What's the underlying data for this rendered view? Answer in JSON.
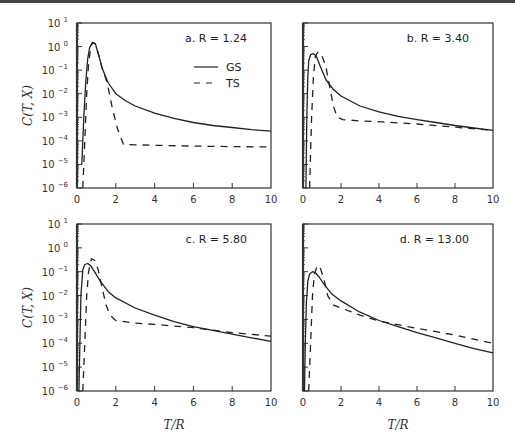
{
  "chart_data": [
    {
      "type": "line",
      "panel": "a",
      "title": "a. R = 1.24",
      "xlabel": "T/R",
      "ylabel": "C(T, X)",
      "xlim": [
        0,
        10
      ],
      "ylim": [
        1e-06,
        10
      ],
      "yscale": "log",
      "xticks": [
        0,
        2,
        4,
        6,
        8,
        10
      ],
      "yticks": [
        "10^1",
        "10^0",
        "10^-1",
        "10^-2",
        "10^-3",
        "10^-4",
        "10^-5",
        "10^-6"
      ],
      "grid": false,
      "legend": [
        "GS",
        "TS"
      ],
      "legend_position": "upper right",
      "series": [
        {
          "name": "GS",
          "style": "solid",
          "x": [
            0.25,
            0.35,
            0.45,
            0.55,
            0.65,
            0.8,
            0.95,
            1.1,
            1.3,
            1.6,
            2.0,
            2.5,
            3,
            4,
            5,
            6,
            7,
            8,
            9,
            10
          ],
          "y": [
            1e-05,
            0.001,
            0.03,
            0.3,
            0.9,
            1.5,
            1.3,
            0.5,
            0.12,
            0.03,
            0.01,
            0.005,
            0.003,
            0.0015,
            0.0009,
            0.0006,
            0.00045,
            0.00037,
            0.0003,
            0.00026
          ]
        },
        {
          "name": "TS",
          "style": "dashed",
          "x": [
            0.3,
            0.4,
            0.5,
            0.6,
            0.7,
            0.8,
            0.95,
            1.1,
            1.3,
            1.55,
            1.8,
            2.1,
            2.4,
            3,
            4,
            6,
            8,
            10
          ],
          "y": [
            1e-06,
            0.0001,
            0.01,
            0.2,
            0.8,
            1.5,
            1.3,
            0.5,
            0.12,
            0.03,
            0.003,
            0.0003,
            7e-05,
            6.8e-05,
            6.5e-05,
            6e-05,
            5.7e-05,
            5.5e-05
          ]
        }
      ]
    },
    {
      "type": "line",
      "panel": "b",
      "title": "b. R = 3.40",
      "xlabel": "",
      "ylabel": "",
      "xlim": [
        0,
        10
      ],
      "ylim": [
        1e-06,
        10
      ],
      "yscale": "log",
      "xticks": [
        0,
        2,
        4,
        6,
        8,
        10
      ],
      "grid": false,
      "series": [
        {
          "name": "GS",
          "style": "solid",
          "x": [
            0.15,
            0.2,
            0.25,
            0.3,
            0.4,
            0.55,
            0.7,
            0.9,
            1.2,
            1.6,
            2,
            3,
            4,
            5,
            6,
            7,
            8,
            9,
            10
          ],
          "y": [
            1e-06,
            0.001,
            0.05,
            0.25,
            0.45,
            0.5,
            0.4,
            0.15,
            0.04,
            0.015,
            0.008,
            0.003,
            0.0017,
            0.0011,
            0.0008,
            0.0006,
            0.00045,
            0.00035,
            0.00028
          ]
        },
        {
          "name": "TS",
          "style": "dashed",
          "x": [
            0.35,
            0.45,
            0.55,
            0.65,
            0.8,
            1.0,
            1.2,
            1.4,
            1.6,
            1.8,
            2.1,
            3,
            4,
            6,
            8,
            9.5,
            10
          ],
          "y": [
            1e-06,
            0.001,
            0.05,
            0.4,
            0.6,
            0.4,
            0.15,
            0.02,
            0.003,
            0.001,
            0.0008,
            0.0007,
            0.00065,
            0.00052,
            0.00038,
            0.0003,
            0.00028
          ]
        }
      ]
    },
    {
      "type": "line",
      "panel": "c",
      "title": "c. R = 5.80",
      "xlabel": "T/R",
      "ylabel": "C(T, X)",
      "xlim": [
        0,
        10
      ],
      "ylim": [
        1e-06,
        10
      ],
      "yscale": "log",
      "xticks": [
        0,
        2,
        4,
        6,
        8,
        10
      ],
      "yticks": [
        "10^1",
        "10^0",
        "10^-1",
        "10^-2",
        "10^-3",
        "10^-4",
        "10^-5",
        "10^-6"
      ],
      "grid": false,
      "series": [
        {
          "name": "GS",
          "style": "solid",
          "x": [
            0.1,
            0.15,
            0.2,
            0.3,
            0.4,
            0.55,
            0.7,
            0.9,
            1.2,
            1.6,
            2,
            3,
            4,
            5,
            6,
            7,
            8,
            9,
            10
          ],
          "y": [
            1e-06,
            0.0001,
            0.01,
            0.12,
            0.2,
            0.22,
            0.18,
            0.1,
            0.04,
            0.015,
            0.008,
            0.003,
            0.0015,
            0.0008,
            0.0005,
            0.00035,
            0.00024,
            0.00017,
            0.00012
          ]
        },
        {
          "name": "TS",
          "style": "dashed",
          "x": [
            0.3,
            0.4,
            0.5,
            0.6,
            0.75,
            0.9,
            1.1,
            1.3,
            1.5,
            1.7,
            2.0,
            3,
            4,
            6,
            8,
            10
          ],
          "y": [
            1e-06,
            0.0001,
            0.01,
            0.1,
            0.35,
            0.3,
            0.12,
            0.02,
            0.004,
            0.0015,
            0.0009,
            0.0007,
            0.00062,
            0.00045,
            0.00028,
            0.0002
          ]
        }
      ]
    },
    {
      "type": "line",
      "panel": "d",
      "title": "d. R = 13.00",
      "xlabel": "T/R",
      "ylabel": "",
      "xlim": [
        0,
        10
      ],
      "ylim": [
        1e-06,
        10
      ],
      "yscale": "log",
      "xticks": [
        0,
        2,
        4,
        6,
        8,
        10
      ],
      "grid": false,
      "series": [
        {
          "name": "GS",
          "style": "solid",
          "x": [
            0.08,
            0.12,
            0.18,
            0.25,
            0.35,
            0.5,
            0.65,
            0.85,
            1.1,
            1.5,
            2,
            3,
            4,
            5,
            6,
            7,
            8,
            9,
            10
          ],
          "y": [
            1e-06,
            0.0001,
            0.005,
            0.04,
            0.08,
            0.1,
            0.09,
            0.06,
            0.03,
            0.012,
            0.006,
            0.002,
            0.0009,
            0.0005,
            0.00028,
            0.00017,
            0.0001,
            6e-05,
            4e-05
          ]
        },
        {
          "name": "TS",
          "style": "dashed",
          "x": [
            0.3,
            0.4,
            0.5,
            0.6,
            0.75,
            0.9,
            1.1,
            1.3,
            1.6,
            2.0,
            3,
            4,
            5,
            6,
            8,
            10
          ],
          "y": [
            1e-06,
            0.0001,
            0.01,
            0.08,
            0.18,
            0.15,
            0.05,
            0.01,
            0.004,
            0.003,
            0.0015,
            0.00085,
            0.0006,
            0.00042,
            0.00022,
            0.0001
          ]
        }
      ]
    }
  ],
  "panels": [
    {
      "id": "a",
      "label": "a. R = 1.24",
      "ylabel": "C(T, X)",
      "xlabel": "",
      "show_legend": true
    },
    {
      "id": "b",
      "label": "b. R = 3.40",
      "ylabel": "",
      "xlabel": "",
      "show_legend": false
    },
    {
      "id": "c",
      "label": "c. R = 5.80",
      "ylabel": "C(T, X)",
      "xlabel": "T/R",
      "show_legend": false
    },
    {
      "id": "d",
      "label": "d. R = 13.00",
      "ylabel": "",
      "xlabel": "T/R",
      "show_legend": false
    }
  ],
  "legend": {
    "solid_label": "GS",
    "dashed_label": "TS"
  },
  "axes": {
    "x_ticks": [
      "0",
      "2",
      "4",
      "6",
      "8",
      "10"
    ],
    "y_exponents": [
      "1",
      "0",
      "-1",
      "-2",
      "-3",
      "-4",
      "-5",
      "-6"
    ],
    "y_base": "10"
  },
  "colors": {
    "line": "#222222",
    "axis": "#333333",
    "background": "#ffffff"
  }
}
